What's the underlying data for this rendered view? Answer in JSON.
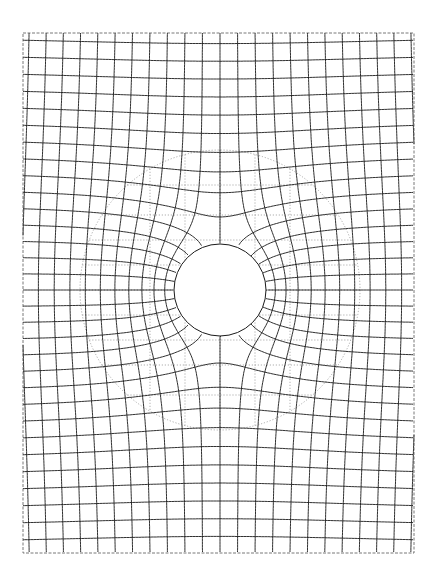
{
  "figure": {
    "width": 442,
    "height": 586,
    "frame": {
      "x0": 23,
      "y0": 33,
      "x1": 414,
      "y1": 553
    },
    "center": {
      "x": 220,
      "y": 290
    },
    "obstacle_radius": 46,
    "dotted_circle_radius": 140,
    "mesh": {
      "scale": 0.9,
      "spacing": 17,
      "levels": 30,
      "color": "#1a1a1a"
    },
    "dotted_grid": {
      "xs": [
        150,
        185,
        220,
        255,
        290
      ],
      "ys": [
        185,
        215,
        240,
        265,
        290,
        315,
        340,
        365,
        395
      ],
      "color": "#8a8a8a"
    }
  }
}
